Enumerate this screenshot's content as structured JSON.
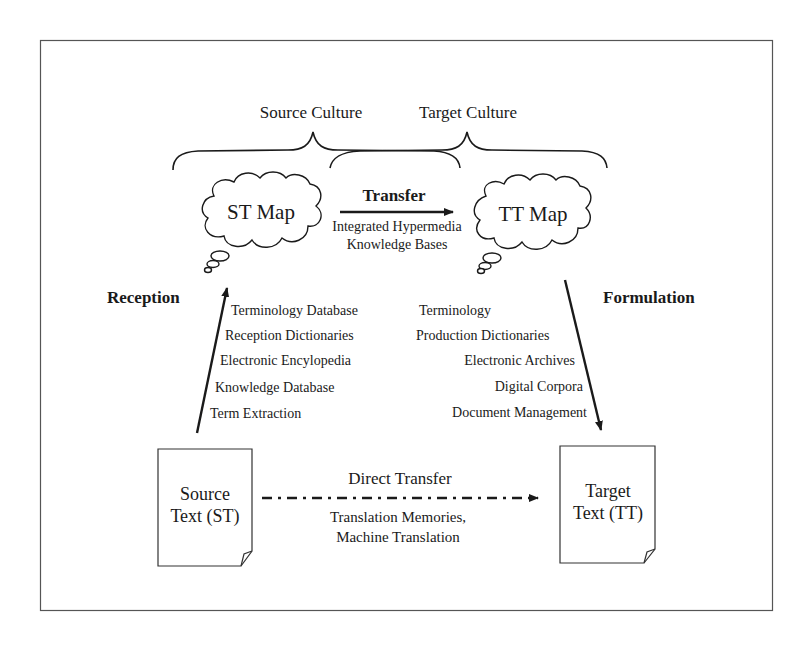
{
  "diagram": {
    "cultures": {
      "source": "Source Culture",
      "target": "Target Culture"
    },
    "maps": {
      "source": "ST Map",
      "target": "TT Map"
    },
    "transfer": {
      "label": "Transfer",
      "tools": [
        "Integrated Hypermedia",
        "Knowledge Bases"
      ]
    },
    "reception": {
      "label": "Reception",
      "tools": [
        "Terminology Database",
        "Reception Dictionaries",
        "Electronic Encylopedia",
        "Knowledge Database",
        "Term Extraction"
      ]
    },
    "formulation": {
      "label": "Formulation",
      "tools": [
        "Terminology",
        "Production Dictionaries",
        "Electronic Archives",
        "Digital Corpora",
        "Document Management"
      ]
    },
    "documents": {
      "source": [
        "Source",
        "Text (ST)"
      ],
      "target": [
        "Target",
        "Text (TT)"
      ]
    },
    "direct_transfer": {
      "label": "Direct Transfer",
      "tools": [
        "Translation Memories,",
        "Machine Translation"
      ]
    },
    "colors": {
      "stroke": "#1a1a1a",
      "frame": "#555555",
      "background": "#ffffff"
    }
  }
}
